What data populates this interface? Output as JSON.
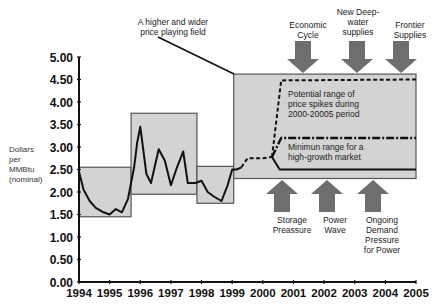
{
  "chart_data": {
    "type": "line",
    "title": "",
    "xlabel": "",
    "ylabel": "Dollars per MMBtu (nominal)",
    "ylim": [
      0,
      5
    ],
    "xlim": [
      1994,
      2005
    ],
    "grid": false,
    "x_ticks": [
      "1994",
      "1995",
      "1996",
      "1997",
      "1998",
      "1999",
      "2000",
      "2001",
      "2002",
      "2003",
      "2004",
      "2005"
    ],
    "y_ticks": [
      "0.00",
      "0.50",
      "1.00",
      "1.50",
      "2.00",
      "2.50",
      "3.00",
      "3.50",
      "4.00",
      "4.50",
      "5.00"
    ],
    "series": [
      {
        "name": "Historical price",
        "style": "solid",
        "x": [
          1994.0,
          1994.15,
          1994.35,
          1994.55,
          1994.8,
          1995.0,
          1995.2,
          1995.4,
          1995.6,
          1995.8,
          1995.9,
          1996.0,
          1996.2,
          1996.35,
          1996.6,
          1996.8,
          1997.0,
          1997.2,
          1997.4,
          1997.55,
          1997.8,
          1998.0,
          1998.2,
          1998.4,
          1998.65,
          1998.85,
          1999.0,
          1999.15,
          1999.3
        ],
        "values": [
          2.45,
          2.05,
          1.8,
          1.65,
          1.55,
          1.5,
          1.62,
          1.55,
          1.85,
          2.55,
          3.1,
          3.45,
          2.4,
          2.2,
          2.95,
          2.7,
          2.15,
          2.55,
          2.9,
          2.2,
          2.2,
          2.25,
          2.0,
          1.9,
          1.8,
          2.15,
          2.5,
          2.5,
          2.55
        ]
      },
      {
        "name": "Transition (projected)",
        "style": "dashed",
        "x": [
          1999.3,
          1999.5,
          2000.0,
          2000.3
        ],
        "values": [
          2.55,
          2.75,
          2.75,
          2.78
        ]
      },
      {
        "name": "Potential range of price spikes (upper)",
        "style": "dashed",
        "x": [
          2000.3,
          2000.6,
          2005.0
        ],
        "values": [
          2.78,
          4.48,
          4.5
        ]
      },
      {
        "name": "Minimum range for a high-growth market (upper)",
        "style": "dash-dot",
        "x": [
          2000.3,
          2000.6,
          2005.0
        ],
        "values": [
          2.78,
          3.2,
          3.2
        ]
      },
      {
        "name": "Minimum range (lower)",
        "style": "solid",
        "x": [
          2000.3,
          2000.55,
          2005.0
        ],
        "values": [
          2.78,
          2.5,
          2.5
        ]
      }
    ],
    "range_boxes": [
      {
        "x0": 1994.0,
        "x1": 1995.7,
        "y0": 1.45,
        "y1": 2.55
      },
      {
        "x0": 1995.7,
        "x1": 1997.85,
        "y0": 1.95,
        "y1": 3.75
      },
      {
        "x0": 1997.85,
        "x1": 1999.05,
        "y0": 1.75,
        "y1": 2.57
      },
      {
        "x0": 1999.05,
        "x1": 2005.0,
        "y0": 2.3,
        "y1": 4.62
      }
    ],
    "annotations": [
      {
        "text": "A higher and wider price playing field",
        "type": "callout"
      },
      {
        "text": "Potential range of price spikes during 2000-20005 period",
        "type": "label"
      },
      {
        "text": "Minimun range for a high-growth market",
        "type": "label"
      },
      {
        "text": "Economic Cycle",
        "type": "down-arrow"
      },
      {
        "text": "New Deep-water supplies",
        "type": "down-arrow"
      },
      {
        "text": "Frontier Supplies",
        "type": "down-arrow"
      },
      {
        "text": "Storage Preassure",
        "type": "up-arrow"
      },
      {
        "text": "Power Wave",
        "type": "up-arrow"
      },
      {
        "text": "Ongoing Demand Pressure for Power",
        "type": "up-arrow"
      }
    ]
  },
  "labels": {
    "y_axis": [
      "Dollars",
      "per",
      "MMBtu",
      "(nominal)"
    ],
    "callout": [
      "A higher and wider",
      "price playing field"
    ],
    "spike_range": [
      "Potential range of",
      "price spikes during",
      "2000-20005 period"
    ],
    "min_range": [
      "Minimun range for a",
      "high-growth market"
    ],
    "down_arrows": [
      {
        "lines": [
          "Economic",
          "Cycle"
        ]
      },
      {
        "lines": [
          "New Deep-",
          "water",
          "supplies"
        ]
      },
      {
        "lines": [
          "Frontier",
          "Supplies"
        ]
      }
    ],
    "up_arrows": [
      {
        "lines": [
          "Storage",
          "Preassure"
        ]
      },
      {
        "lines": [
          "Power",
          "Wave"
        ]
      },
      {
        "lines": [
          "Ongoing",
          "Demand",
          "Pressure",
          "for Power"
        ]
      }
    ]
  },
  "colors": {
    "box_fill": "#d3d3d3",
    "box_stroke": "#555555",
    "line": "#111111",
    "arrow": "#6e6e6e",
    "axis": "#111111"
  }
}
